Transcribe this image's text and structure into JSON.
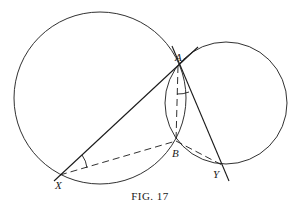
{
  "figure": {
    "caption": "FIG. 17",
    "points": {
      "A": {
        "label": "A",
        "x": 178,
        "y": 66
      },
      "B": {
        "label": "B",
        "x": 176,
        "y": 141
      },
      "X": {
        "label": "X",
        "x": 60,
        "y": 175
      },
      "Y": {
        "label": "Y",
        "x": 222,
        "y": 165
      }
    },
    "circles": [
      {
        "name": "large-circle",
        "cx": 100,
        "cy": 98,
        "r": 86
      },
      {
        "name": "small-circle",
        "cx": 226,
        "cy": 103,
        "r": 61
      }
    ],
    "solid_lines": [
      "X-A (extended tangent)",
      "A-Y (extended)"
    ],
    "dashed_lines": [
      "X-B",
      "B-Y",
      "A-B"
    ],
    "angle_marks": [
      "angle AXB",
      "angle BAY"
    ],
    "colors": {
      "stroke": "#1a1a1a",
      "background": "#ffffff"
    }
  }
}
